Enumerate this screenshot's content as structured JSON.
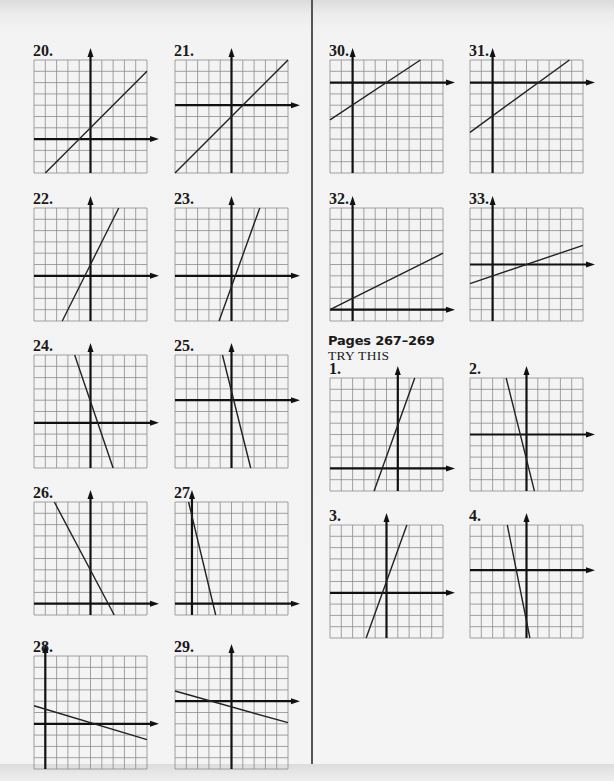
{
  "page": {
    "section": {
      "heading": "Pages 267–269",
      "subheading": "TRY THIS"
    },
    "style": {
      "grid_color": "#8a8a8a",
      "axis_color": "#111111",
      "line_color": "#222222",
      "cell_size": 11.3,
      "grid_cells": 10
    },
    "graphs": [
      {
        "id": "20",
        "label": "20.",
        "x": 34,
        "y": 60,
        "axis_col": 5,
        "axis_row": 7,
        "line": [
          [
            1,
            10
          ],
          [
            10,
            1
          ]
        ]
      },
      {
        "id": "21",
        "label": "21.",
        "x": 175,
        "y": 60,
        "axis_col": 5,
        "axis_row": 4,
        "line": [
          [
            0,
            10
          ],
          [
            10,
            0
          ]
        ]
      },
      {
        "id": "22",
        "label": "22.",
        "x": 34,
        "y": 208,
        "axis_col": 5,
        "axis_row": 6,
        "line": [
          [
            7.5,
            0
          ],
          [
            2.5,
            10
          ]
        ]
      },
      {
        "id": "23",
        "label": "23.",
        "x": 175,
        "y": 208,
        "axis_col": 5,
        "axis_row": 6,
        "line": [
          [
            7.5,
            0
          ],
          [
            3.9,
            10
          ]
        ]
      },
      {
        "id": "24",
        "label": "24.",
        "x": 34,
        "y": 355,
        "axis_col": 5,
        "axis_row": 6,
        "line": [
          [
            3.6,
            0
          ],
          [
            7,
            10
          ]
        ]
      },
      {
        "id": "25",
        "label": "25.",
        "x": 175,
        "y": 355,
        "axis_col": 5,
        "axis_row": 4,
        "line": [
          [
            4.2,
            0
          ],
          [
            6.7,
            10
          ]
        ]
      },
      {
        "id": "26",
        "label": "26.",
        "x": 34,
        "y": 502,
        "axis_col": 5,
        "axis_row": 9,
        "line": [
          [
            1.8,
            0
          ],
          [
            7.1,
            10
          ]
        ]
      },
      {
        "id": "27",
        "label": "27.",
        "x": 175,
        "y": 502,
        "axis_col": 1.5,
        "axis_row": 9,
        "line": [
          [
            1.2,
            0
          ],
          [
            3.6,
            10
          ]
        ]
      },
      {
        "id": "28",
        "label": "28.",
        "x": 34,
        "y": 656,
        "axis_col": 1,
        "axis_row": 6,
        "line": [
          [
            0,
            4.4
          ],
          [
            10,
            7.4
          ]
        ]
      },
      {
        "id": "29",
        "label": "29.",
        "x": 175,
        "y": 656,
        "axis_col": 5,
        "axis_row": 4,
        "line": [
          [
            0,
            3.1
          ],
          [
            10,
            5.9
          ]
        ]
      },
      {
        "id": "30",
        "label": "30.",
        "x": 330,
        "y": 60,
        "axis_col": 2,
        "axis_row": 2,
        "line": [
          [
            0,
            5.3
          ],
          [
            8,
            0
          ]
        ]
      },
      {
        "id": "31",
        "label": "31.",
        "x": 470,
        "y": 60,
        "axis_col": 2,
        "axis_row": 2,
        "line": [
          [
            0,
            6.4
          ],
          [
            8.8,
            0
          ]
        ]
      },
      {
        "id": "32",
        "label": "32.",
        "x": 330,
        "y": 208,
        "axis_col": 2,
        "axis_row": 9,
        "line": [
          [
            0,
            9
          ],
          [
            10,
            4
          ]
        ]
      },
      {
        "id": "33",
        "label": "33.",
        "x": 470,
        "y": 208,
        "axis_col": 2,
        "axis_row": 5,
        "line": [
          [
            0,
            6.7
          ],
          [
            10,
            3.3
          ]
        ]
      },
      {
        "id": "try-1",
        "label": "1.",
        "x": 330,
        "y": 378,
        "axis_col": 6,
        "axis_row": 8,
        "line": [
          [
            7.5,
            0
          ],
          [
            3.9,
            10
          ]
        ]
      },
      {
        "id": "try-2",
        "label": "2.",
        "x": 470,
        "y": 378,
        "axis_col": 5,
        "axis_row": 5,
        "line": [
          [
            3.2,
            0
          ],
          [
            5.7,
            10
          ]
        ]
      },
      {
        "id": "try-3",
        "label": "3.",
        "x": 330,
        "y": 525,
        "axis_col": 5,
        "axis_row": 6,
        "line": [
          [
            6.8,
            0
          ],
          [
            3.2,
            10
          ]
        ]
      },
      {
        "id": "try-4",
        "label": "4.",
        "x": 470,
        "y": 525,
        "axis_col": 5,
        "axis_row": 4,
        "line": [
          [
            3.3,
            0
          ],
          [
            5.3,
            10
          ]
        ]
      }
    ]
  }
}
